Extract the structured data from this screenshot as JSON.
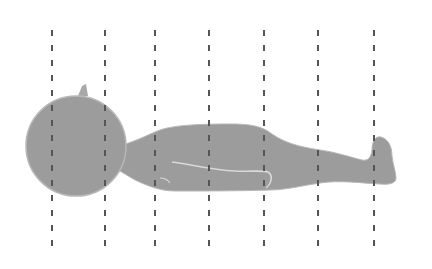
{
  "diagram": {
    "colors": {
      "background": "#ffffff",
      "silhouette": "#9c9c9c",
      "silhouette_edge": "#b8b8b8",
      "highlight": "#d8d8d8",
      "dash_line": "#555555"
    },
    "section_lines": {
      "count": 7,
      "x_positions": [
        52,
        105,
        155,
        209,
        264,
        318,
        374
      ],
      "y_top": 30,
      "y_bottom": 247
    }
  }
}
